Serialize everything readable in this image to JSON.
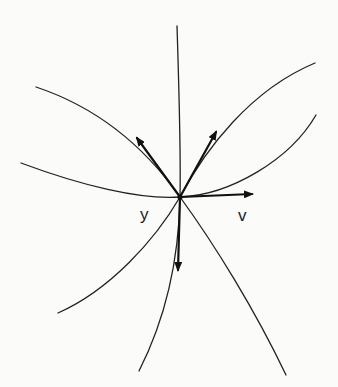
{
  "diagram": {
    "labels": {
      "point": "y",
      "vector": "v"
    },
    "colors": {
      "ink": "#222222",
      "background": "#fbfbfa"
    },
    "center": {
      "x": 180,
      "y": 197
    },
    "curves": [
      {
        "id": "vertical",
        "description": "near-vertical curve from top through y to bottom"
      },
      {
        "id": "upper-left-to-lower-right",
        "description": "curve from upper left through y to lower right"
      },
      {
        "id": "left-horizontal-to-upper-right",
        "description": "nearly horizontal curve from left through y bending up to the right"
      },
      {
        "id": "lower-left-to-upper-right",
        "description": "curve from lower left through y to upper right"
      }
    ],
    "vectors": [
      {
        "id": "tangent-upper-left",
        "direction": "up-left"
      },
      {
        "id": "tangent-upper-right",
        "direction": "up-right"
      },
      {
        "id": "v",
        "direction": "right"
      },
      {
        "id": "tangent-down",
        "direction": "down"
      }
    ]
  }
}
